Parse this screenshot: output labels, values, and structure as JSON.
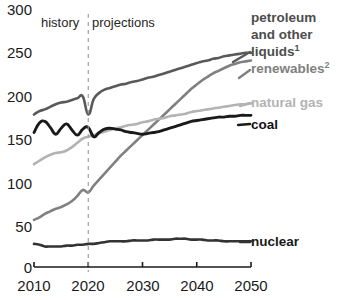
{
  "chart_data": {
    "type": "line",
    "title": "",
    "subtitle": "",
    "xlabel": "",
    "ylabel": "",
    "xlim": [
      2010,
      2050
    ],
    "ylim": [
      0,
      300
    ],
    "grid": false,
    "legend_position": "right-inline-labels",
    "xticks": [
      2010,
      2020,
      2030,
      2040,
      2050
    ],
    "yticks": [
      0,
      50,
      100,
      150,
      200,
      250,
      300
    ],
    "annotations": [
      {
        "name": "history",
        "text": "history",
        "x": 2015
      },
      {
        "name": "projections",
        "text": "projections",
        "x": 2027
      },
      {
        "name": "divider",
        "text": "",
        "x": 2020,
        "style": "dashed-vertical"
      }
    ],
    "x": [
      2010,
      2011,
      2012,
      2013,
      2014,
      2015,
      2016,
      2017,
      2018,
      2019,
      2020,
      2021,
      2022,
      2023,
      2024,
      2025,
      2026,
      2027,
      2028,
      2029,
      2030,
      2031,
      2032,
      2033,
      2034,
      2035,
      2036,
      2037,
      2038,
      2039,
      2040,
      2041,
      2042,
      2043,
      2044,
      2045,
      2046,
      2047,
      2048,
      2049,
      2050
    ],
    "series": [
      {
        "name": "petroleum and other liquids",
        "label": "petroleum and other liquids",
        "superscript": "1",
        "color": "#595959",
        "values": [
          178,
          182,
          184,
          187,
          190,
          192,
          193,
          195,
          197,
          199,
          178,
          196,
          203,
          207,
          209,
          211,
          213,
          214,
          216,
          217,
          219,
          221,
          222,
          224,
          226,
          228,
          230,
          232,
          234,
          236,
          238,
          240,
          241,
          243,
          244,
          246,
          247,
          248,
          249,
          250,
          250
        ]
      },
      {
        "name": "renewables",
        "label": "renewables",
        "superscript": "2",
        "color": "#808080",
        "values": [
          55,
          58,
          62,
          65,
          68,
          70,
          73,
          77,
          83,
          90,
          87,
          95,
          102,
          109,
          116,
          123,
          130,
          136,
          142,
          148,
          154,
          160,
          166,
          172,
          178,
          184,
          190,
          196,
          202,
          208,
          213,
          218,
          222,
          226,
          229,
          232,
          235,
          237,
          239,
          240,
          241
        ]
      },
      {
        "name": "natural gas",
        "label": "natural gas",
        "superscript": "",
        "color": "#b3b3b3",
        "values": [
          120,
          124,
          128,
          131,
          133,
          134,
          136,
          140,
          145,
          150,
          152,
          154,
          156,
          158,
          160,
          162,
          163,
          165,
          166,
          167,
          169,
          170,
          172,
          173,
          174,
          176,
          177,
          178,
          179,
          181,
          182,
          183,
          184,
          185,
          186,
          187,
          188,
          189,
          190,
          190,
          191
        ]
      },
      {
        "name": "coal",
        "label": "coal",
        "superscript": "",
        "color": "#1a1a1a",
        "values": [
          157,
          168,
          170,
          163,
          155,
          162,
          167,
          160,
          154,
          161,
          163,
          152,
          157,
          161,
          162,
          161,
          160,
          158,
          157,
          156,
          155,
          156,
          157,
          158,
          160,
          162,
          164,
          166,
          168,
          170,
          171,
          172,
          173,
          174,
          175,
          175,
          176,
          176,
          177,
          177,
          177
        ]
      },
      {
        "name": "nuclear",
        "label": "nuclear",
        "superscript": "",
        "color": "#333333",
        "values": [
          27,
          26,
          24,
          24,
          24,
          24,
          25,
          25,
          26,
          26,
          27,
          27,
          28,
          29,
          30,
          30,
          30,
          30,
          31,
          31,
          31,
          31,
          32,
          32,
          32,
          32,
          33,
          33,
          33,
          32,
          32,
          32,
          31,
          31,
          31,
          30,
          30,
          30,
          30,
          30,
          30
        ]
      }
    ]
  },
  "axis": {
    "yticks": [
      "300",
      "250",
      "200",
      "150",
      "100",
      "50",
      "0"
    ],
    "xticks": [
      "2010",
      "2020",
      "2030",
      "2040",
      "2050"
    ]
  },
  "eras": {
    "history": "history",
    "projections": "projections"
  },
  "legend": {
    "petroleum_line1": "petroleum",
    "petroleum_line2": "and other",
    "petroleum_line3": "liquids",
    "petroleum_sup": "1",
    "renewables": "renewables",
    "renewables_sup": "2",
    "natural_gas": "natural gas",
    "coal": "coal",
    "nuclear": "nuclear"
  },
  "colors": {
    "petroleum": "#595959",
    "renewables": "#808080",
    "natural_gas": "#b3b3b3",
    "coal": "#1a1a1a",
    "nuclear": "#333333",
    "axis": "#1a1a1a",
    "divider": "#999999"
  }
}
